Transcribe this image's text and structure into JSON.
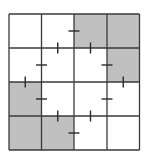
{
  "puzzle": {
    "rows": 4,
    "cols": 4,
    "colors": {
      "background": "#ffffff",
      "shaded": "#c0c0c0",
      "grid_line": "#3a3a3a",
      "tick": "#2a2a2a"
    },
    "shaded_cells": [
      {
        "row": 0,
        "col": 2
      },
      {
        "row": 0,
        "col": 3
      },
      {
        "row": 1,
        "col": 3
      },
      {
        "row": 2,
        "col": 0
      },
      {
        "row": 3,
        "col": 0
      },
      {
        "row": 3,
        "col": 1
      }
    ],
    "edge_marks": [
      {
        "type": "vertical-edge",
        "row": 0,
        "between_cols": [
          1,
          2
        ]
      },
      {
        "type": "horizontal-edge",
        "col": 1,
        "between_rows": [
          0,
          1
        ]
      },
      {
        "type": "horizontal-edge",
        "col": 2,
        "between_rows": [
          0,
          1
        ]
      },
      {
        "type": "vertical-edge",
        "row": 1,
        "between_cols": [
          0,
          1
        ]
      },
      {
        "type": "vertical-edge",
        "row": 1,
        "between_cols": [
          2,
          3
        ]
      },
      {
        "type": "horizontal-edge",
        "col": 0,
        "between_rows": [
          1,
          2
        ]
      },
      {
        "type": "horizontal-edge",
        "col": 3,
        "between_rows": [
          1,
          2
        ]
      },
      {
        "type": "vertical-edge",
        "row": 2,
        "between_cols": [
          0,
          1
        ]
      },
      {
        "type": "vertical-edge",
        "row": 2,
        "between_cols": [
          2,
          3
        ]
      },
      {
        "type": "horizontal-edge",
        "col": 1,
        "between_rows": [
          2,
          3
        ]
      },
      {
        "type": "horizontal-edge",
        "col": 2,
        "between_rows": [
          2,
          3
        ]
      },
      {
        "type": "vertical-edge",
        "row": 3,
        "between_cols": [
          1,
          2
        ]
      }
    ]
  }
}
